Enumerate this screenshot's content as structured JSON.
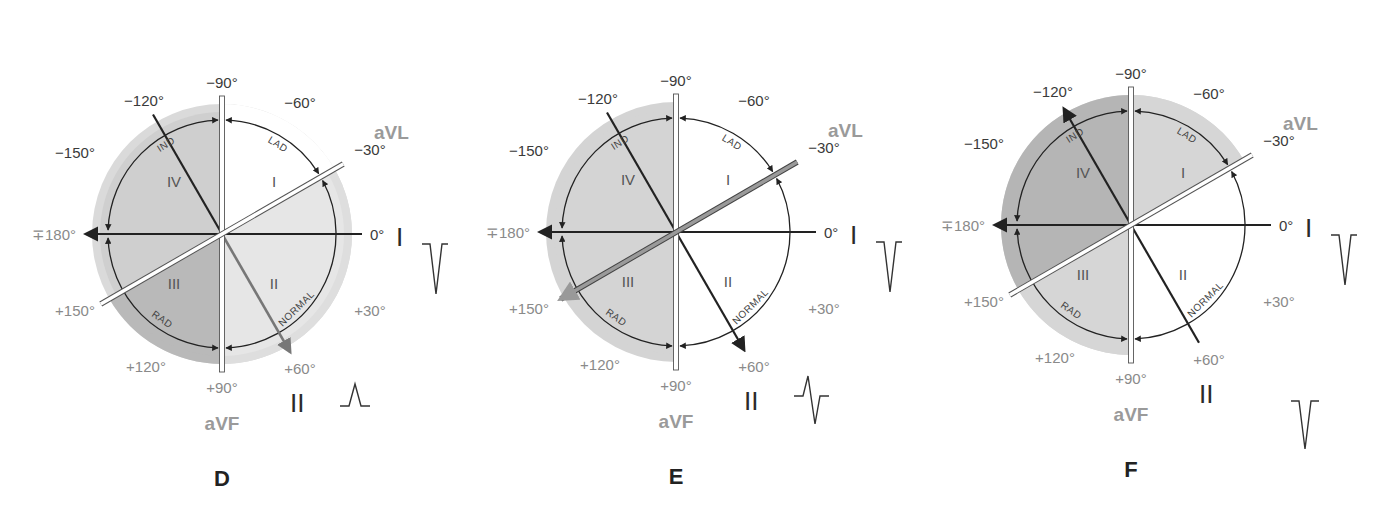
{
  "figure": {
    "panels": [
      {
        "id": "D",
        "label": "D",
        "center": [
          222,
          234
        ],
        "shading": {
          "quadrant_I": "#ffffff",
          "quadrant_II": "#e6e6e6",
          "quadrant_III": "#b9b9b9",
          "quadrant_IV": "#cfcfcf",
          "outer_ring": "#dadada"
        },
        "axis_arrow": {
          "angle_deg": 60,
          "style": "gray",
          "color": "#777777"
        },
        "lead_I_wave": "negative",
        "lead_II_wave": "positive"
      },
      {
        "id": "E",
        "label": "E",
        "center": [
          676,
          232
        ],
        "shading": {
          "quadrant_I": "#ffffff",
          "quadrant_II": "#ffffff",
          "quadrant_III": "#d4d4d4",
          "quadrant_IV": "#d4d4d4",
          "outer_ring": "#d4d4d4"
        },
        "axis_arrow": {
          "angle_deg": 150,
          "style": "gray",
          "color": "#8a8a8a"
        },
        "lead_I_wave": "negative",
        "lead_II_wave": "biphasic"
      },
      {
        "id": "F",
        "label": "F",
        "center": [
          1131,
          225
        ],
        "shading": {
          "quadrant_I": "#d6d6d6",
          "quadrant_II": "#ffffff",
          "quadrant_III": "#d6d6d6",
          "quadrant_IV": "#b5b5b5",
          "outer_ring": "#d6d6d6"
        },
        "axis_arrow": {
          "angle_deg": -120,
          "style": "black",
          "color": "#222222"
        },
        "lead_I_wave": "negative",
        "lead_II_wave": "negative"
      }
    ],
    "angle_labels": {
      "m90": "−90°",
      "m120": "−120°",
      "m60": "−60°",
      "m150": "−150°",
      "m30": "−30°",
      "p180": "∓180°",
      "zero": "0°",
      "p150": "+150°",
      "p30": "+30°",
      "p120": "+120°",
      "p60": "+60°",
      "p90": "+90°"
    },
    "lead_labels": {
      "aVL": "aVL",
      "aVF": "aVF",
      "I": "I",
      "II": "II"
    },
    "quadrant_labels": {
      "q1": "I",
      "q2": "II",
      "q3": "III",
      "q4": "IV"
    },
    "arc_labels": {
      "lad": "LAD",
      "normal": "NORMAL",
      "rad": "RAD",
      "ind": "IND"
    }
  }
}
